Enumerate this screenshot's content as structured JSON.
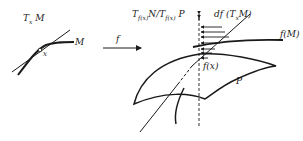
{
  "figure": {
    "left_panel": {
      "tangent_label": "T",
      "tangent_sub": "x",
      "tangent_label_suffix": " M",
      "manifold_label": "M",
      "point_label": "x"
    },
    "map": {
      "label": "f"
    },
    "right_panel": {
      "quotient_label_a": "T",
      "quotient_sub_a": "f(x)",
      "quotient_mid": "N/T",
      "quotient_sub_b": "f(x)",
      "quotient_suffix": " P",
      "differential_label": "df (T",
      "differential_sub": "x",
      "differential_suffix": "M)",
      "image_label": "f(M)",
      "image_point_label": "f(x)",
      "submanifold_label": "P"
    },
    "colors": {
      "ink": "#1a1a1a",
      "background": "#ffffff"
    }
  }
}
